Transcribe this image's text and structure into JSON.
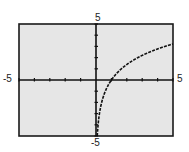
{
  "chart_data": {
    "type": "line",
    "title": "",
    "xlabel": "",
    "ylabel": "",
    "xlim": [
      -5,
      5
    ],
    "ylim": [
      -5,
      5
    ],
    "grid": false,
    "x_tick_step": 1,
    "y_tick_step": 1,
    "tick_labels": {
      "x_min": "-5",
      "x_max": "5",
      "y_min": "-5",
      "y_max": "5"
    },
    "series": [
      {
        "name": "f(x)",
        "approx_function": "y = 2 ln(x)",
        "x": [
          0.1,
          0.2,
          0.3,
          0.5,
          0.75,
          1,
          1.5,
          2,
          2.5,
          3,
          3.5,
          4,
          4.5,
          5
        ],
        "values": [
          -4.6,
          -3.2,
          -2.4,
          -1.4,
          -0.6,
          0,
          0.8,
          1.4,
          1.8,
          2.2,
          2.5,
          2.8,
          3.0,
          3.2
        ]
      }
    ]
  },
  "colors": {
    "plot_background": "#e6e6e6",
    "frame": "#1a1a1a",
    "axes": "#111111",
    "curve": "#111111"
  }
}
